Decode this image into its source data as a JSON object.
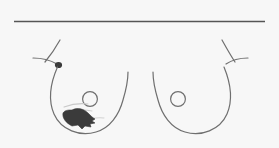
{
  "figure": {
    "type": "anatomical-diagram",
    "background_color": "#f7f7f7",
    "ink_color": "#6f6f6f",
    "marking_color": "#3b3b3b",
    "header": {
      "right_label": "Right",
      "left_label": "Left",
      "divider": "horizontal-rule"
    },
    "breasts": [
      {
        "side": "Right",
        "nipple": "circle-outline",
        "axillary_tail": "present",
        "node_marker": {
          "present": true,
          "name": "axillary-node-marker",
          "shade": "filled-dark"
        },
        "lesion": {
          "present": true,
          "name": "shaded-lesion-mass",
          "shade": "filled-dark",
          "location": "lower-inner-quadrant",
          "hatching": "present"
        }
      },
      {
        "side": "Left",
        "nipple": "circle-outline",
        "axillary_tail": "present",
        "node_marker": {
          "present": false,
          "name": "axillary-node-marker",
          "shade": "none"
        },
        "lesion": {
          "present": false,
          "name": "shaded-lesion-mass",
          "shade": "none",
          "location": "",
          "hatching": "none"
        }
      }
    ]
  }
}
